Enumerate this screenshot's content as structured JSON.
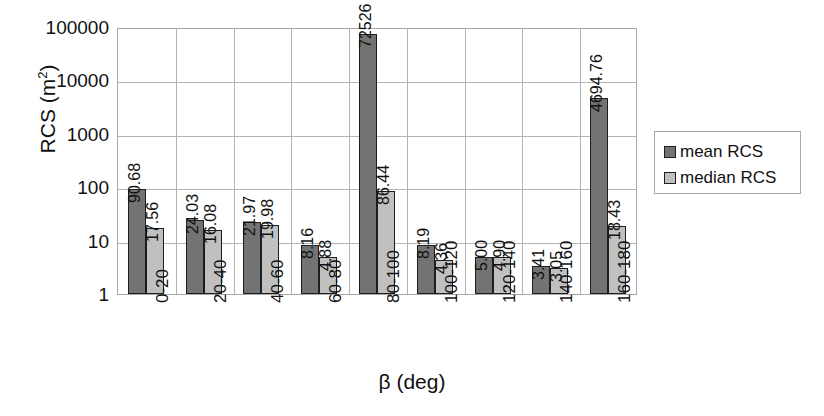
{
  "chart_data": {
    "type": "bar",
    "title": "",
    "xlabel": "β (deg)",
    "ylabel": "RCS (m²)",
    "ylabel_base": "RCS (m",
    "ylabel_sup": "2",
    "ylabel_tail": ")",
    "yscale": "log",
    "ylim": [
      1,
      100000
    ],
    "ytick_labels": [
      "100000",
      "10000",
      "1000",
      "100",
      "10",
      "1"
    ],
    "ytick_values": [
      100000,
      10000,
      1000,
      100,
      10,
      1
    ],
    "grid": true,
    "legend_position": "right",
    "categories": [
      "0-20",
      "20-40",
      "40-60",
      "60-80",
      "80-100",
      "100-120",
      "120-140",
      "140-160",
      "160-180"
    ],
    "series": [
      {
        "name": "mean RCS",
        "color": "#737373",
        "values": [
          90.68,
          24.03,
          21.97,
          8.16,
          72526,
          8.19,
          5.0,
          3.41,
          4694.76
        ],
        "labels": [
          "90.68",
          "24.03",
          "21.97",
          "8.16",
          "72526",
          "8.19",
          "5.00",
          "3.41",
          "4694.76"
        ]
      },
      {
        "name": "median RCS",
        "color": "#c0c0c0",
        "values": [
          17.56,
          16.08,
          19.98,
          4.88,
          86.44,
          4.36,
          4.9,
          3.05,
          18.43
        ],
        "labels": [
          "17.56",
          "16.08",
          "19.98",
          "4.88",
          "86.44",
          "4.36",
          "4.90",
          "3.05",
          "18.43"
        ]
      }
    ]
  },
  "legend": {
    "items": [
      {
        "label": "mean RCS"
      },
      {
        "label": "median RCS"
      }
    ]
  }
}
